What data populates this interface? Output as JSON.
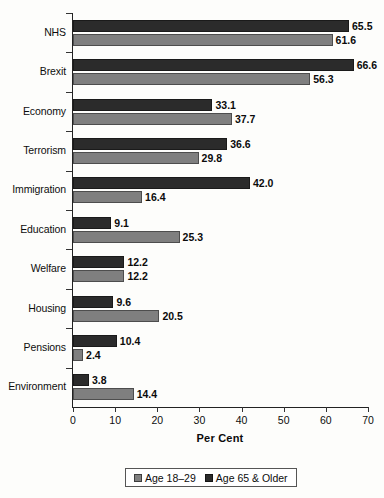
{
  "chart_data": {
    "type": "bar",
    "orientation": "horizontal",
    "title": "",
    "xlabel": "Per Cent",
    "ylabel": "",
    "xlim": [
      0,
      70
    ],
    "xticks": [
      0,
      10,
      20,
      30,
      40,
      50,
      60,
      70
    ],
    "grid": false,
    "legend_position": "bottom",
    "categories": [
      "NHS",
      "Brexit",
      "Economy",
      "Terrorism",
      "Immigration",
      "Education",
      "Welfare",
      "Housing",
      "Pensions",
      "Environment"
    ],
    "series": [
      {
        "name": "Age 65 & Older",
        "color": "#2b2b2b",
        "values": [
          65.5,
          66.6,
          33.1,
          36.6,
          42.0,
          9.1,
          12.2,
          9.6,
          10.4,
          3.8
        ],
        "labels": [
          "65.5",
          "66.6",
          "33.1",
          "36.6",
          "42.0",
          "9.1",
          "12.2",
          "9.6",
          "10.4",
          "3.8"
        ]
      },
      {
        "name": "Age 18–29",
        "color": "#7f7f7f",
        "values": [
          61.6,
          56.3,
          37.7,
          29.8,
          16.4,
          25.3,
          12.2,
          20.5,
          2.4,
          14.4
        ],
        "labels": [
          "61.6",
          "56.3",
          "37.7",
          "29.8",
          "16.4",
          "25.3",
          "12.2",
          "20.5",
          "2.4",
          "14.4"
        ]
      }
    ]
  },
  "legend": {
    "entries": [
      {
        "label": "Age 18–29",
        "swatch": "young"
      },
      {
        "label": "Age 65 & Older",
        "swatch": "old"
      }
    ]
  }
}
